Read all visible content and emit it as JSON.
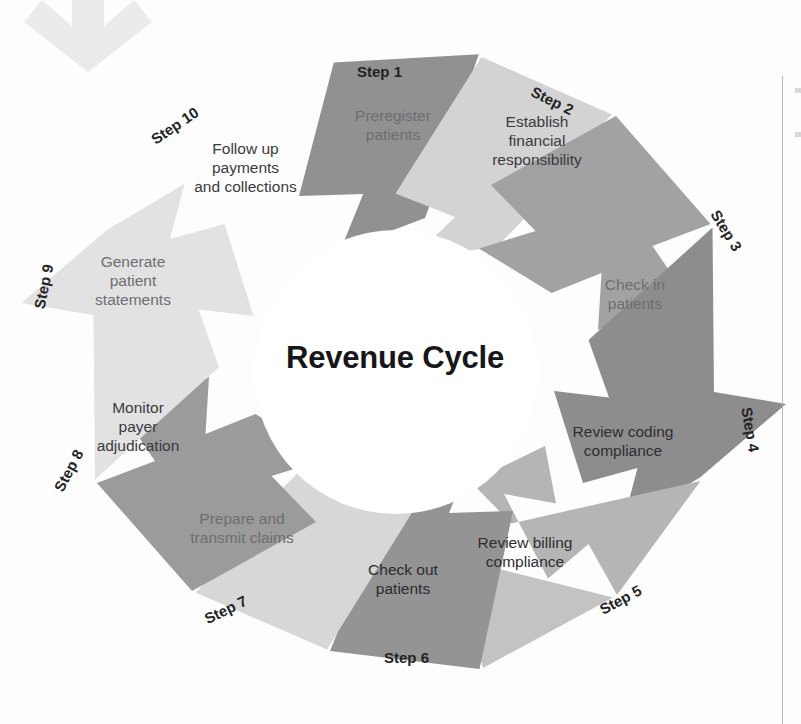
{
  "diagram": {
    "center_title": "Revenue Cycle",
    "type": "circular-cycle",
    "step_count": 10,
    "palette": {
      "dark_gray": "#8f8f8f",
      "mid_gray": "#a3a3a3",
      "light_gray": "#d2d2d2",
      "pale_gray": "#bdbdbd",
      "very_light_gray": "#e4e4e4",
      "title_color": "#17171a",
      "decor_arrow": "#ebebeb"
    },
    "decor": {
      "top_arrow_name": "down-arrow-decoration"
    }
  },
  "steps": [
    {
      "step_label": "Step 1",
      "text": "Preregister\npatients",
      "line1": "Preregister",
      "line2": "patients",
      "line3": ""
    },
    {
      "step_label": "Step 2",
      "text": "Establish financial responsibility",
      "line1": "Establish",
      "line2": "financial",
      "line3": "responsibility"
    },
    {
      "step_label": "Step 3",
      "text": "Check in patients",
      "line1": "Check in",
      "line2": "patients",
      "line3": ""
    },
    {
      "step_label": "Step 4",
      "text": "Review coding compliance",
      "line1": "Review coding",
      "line2": "compliance",
      "line3": ""
    },
    {
      "step_label": "Step 5",
      "text": "Review billing compliance",
      "line1": "Review billing",
      "line2": "compliance",
      "line3": ""
    },
    {
      "step_label": "Step 6",
      "text": "Check out patients",
      "line1": "Check out",
      "line2": "patients",
      "line3": ""
    },
    {
      "step_label": "Step 7",
      "text": "Prepare and transmit claims",
      "line1": "Prepare and",
      "line2": "transmit claims",
      "line3": ""
    },
    {
      "step_label": "Step 8",
      "text": "Monitor payer adjudication",
      "line1": "Monitor",
      "line2": "payer",
      "line3": "adjudication"
    },
    {
      "step_label": "Step 9",
      "text": "Generate patient statements",
      "line1": "Generate",
      "line2": "patient",
      "line3": "statements"
    },
    {
      "step_label": "Step 10",
      "text": "Follow up payments and collections",
      "line1": "Follow up",
      "line2": "payments",
      "line3": "and collections"
    }
  ]
}
